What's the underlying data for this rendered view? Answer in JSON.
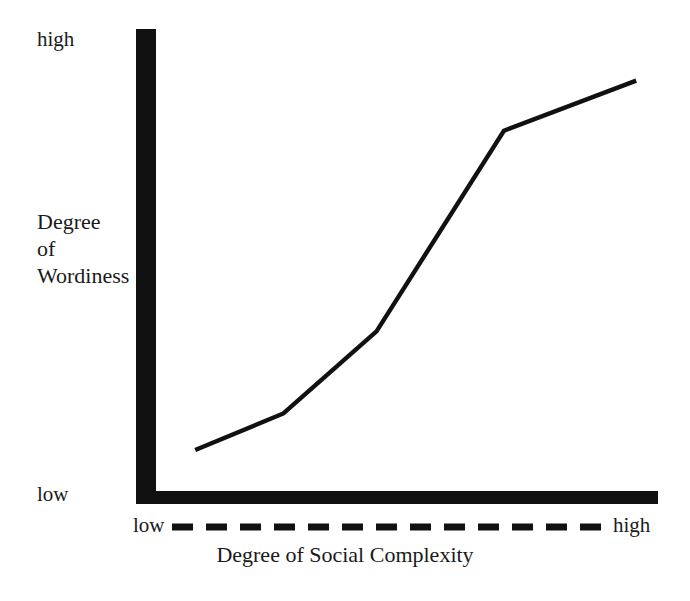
{
  "chart_data": {
    "type": "line",
    "title": "",
    "subtitle": "",
    "xlabel": "Degree of Social Complexity",
    "ylabel": "Degree of Wordiness",
    "ylabel_lines": [
      "Degree",
      "of",
      "Wordiness"
    ],
    "x_tick_labels": [
      "low",
      "high"
    ],
    "y_tick_labels": [
      "high",
      "low"
    ],
    "xlim": [
      0,
      100
    ],
    "ylim": [
      0,
      100
    ],
    "grid": false,
    "legend": null,
    "annotations": [],
    "series": [
      {
        "name": "Wordiness vs Social Complexity",
        "x": [
          8,
          26,
          45,
          71,
          98
        ],
        "y": [
          9,
          17,
          35,
          79,
          90
        ],
        "color": "#111111"
      }
    ],
    "axis_style": {
      "y_axis": "thick-solid-bar",
      "x_axis": "thick-solid-bar",
      "x_range_indicator": "dashed-line",
      "axis_color": "#111111"
    }
  },
  "labels": {
    "y_high": "high",
    "y_low": "low",
    "x_low": "low",
    "x_high": "high",
    "y_title_line1": "Degree",
    "y_title_line2": "of",
    "y_title_line3": "Wordiness",
    "x_title": "Degree of Social Complexity"
  }
}
